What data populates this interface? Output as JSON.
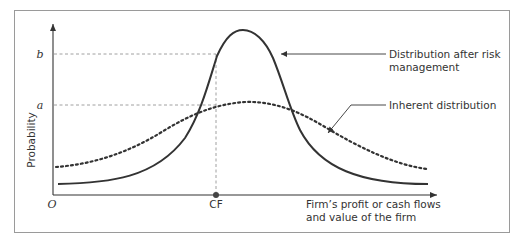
{
  "diagram": {
    "y_axis_label": "Probability",
    "x_axis_label_line1": "Firm’s profit or cash flows",
    "x_axis_label_line2": "and value of the firm",
    "origin_label": "O",
    "y_ticks": {
      "b": "b",
      "a": "a"
    },
    "x_ticks": {
      "cf": "CF"
    },
    "annotations": {
      "risk_managed_line1": "Distribution after risk",
      "risk_managed_line2": "management",
      "inherent": "Inherent distribution"
    },
    "colors": {
      "curve": "#333333",
      "frame": "#999999",
      "guides": "#888888"
    }
  }
}
